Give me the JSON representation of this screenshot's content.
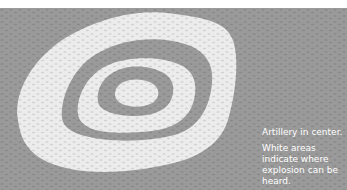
{
  "figure": {
    "caption_line1": "Artillery in center.",
    "caption_line2": "White areas indicate where explosion can be heard.",
    "colors": {
      "background_gray": "#9a9a9a",
      "zone_white": "#ececec",
      "caption_text": "#ffffff"
    }
  }
}
